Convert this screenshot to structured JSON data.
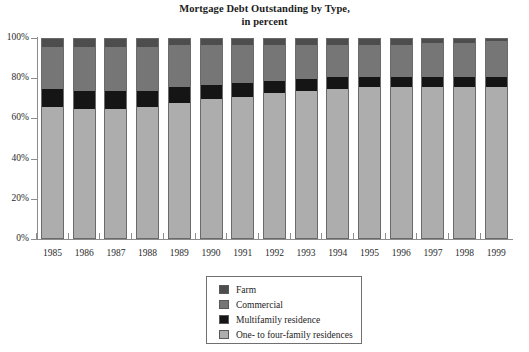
{
  "chart_data": {
    "type": "bar",
    "stacked": true,
    "title": "Mortgage Debt Outstanding by Type,",
    "subtitle": "in percent",
    "xlabel": "",
    "ylabel": "",
    "ylim": [
      0,
      100
    ],
    "yticks": [
      "0%",
      "20%",
      "40%",
      "60%",
      "80%",
      "100%"
    ],
    "ytick_values": [
      0,
      20,
      40,
      60,
      80,
      100
    ],
    "grid": false,
    "legend_position": "bottom-center",
    "categories": [
      "1985",
      "1986",
      "1987",
      "1988",
      "1989",
      "1990",
      "1991",
      "1992",
      "1993",
      "1994",
      "1995",
      "1996",
      "1997",
      "1998",
      "1999"
    ],
    "series": [
      {
        "name": "One- to four-family residences",
        "color": "#adadad",
        "values": [
          66,
          65,
          65,
          66,
          68,
          70,
          71,
          73,
          74,
          75,
          76,
          76,
          76,
          76,
          76
        ]
      },
      {
        "name": "Multifamily residence",
        "color": "#151515",
        "values": [
          9,
          9,
          9,
          8,
          8,
          7,
          7,
          6,
          6,
          6,
          5,
          5,
          5,
          5,
          5
        ]
      },
      {
        "name": "Commercial",
        "color": "#767676",
        "values": [
          21,
          22,
          22,
          22,
          21,
          20,
          19,
          18,
          17,
          16,
          16,
          16,
          17,
          17,
          18
        ]
      },
      {
        "name": "Farm",
        "color": "#4d4d4d",
        "values": [
          4,
          4,
          4,
          4,
          3,
          3,
          3,
          3,
          3,
          3,
          3,
          3,
          2,
          2,
          1
        ]
      }
    ]
  },
  "legend": {
    "items": [
      {
        "label": "Farm",
        "color": "#4d4d4d"
      },
      {
        "label": "Commercial",
        "color": "#767676"
      },
      {
        "label": "Multifamily residence",
        "color": "#151515"
      },
      {
        "label": "One- to four-family residences",
        "color": "#adadad"
      }
    ]
  }
}
